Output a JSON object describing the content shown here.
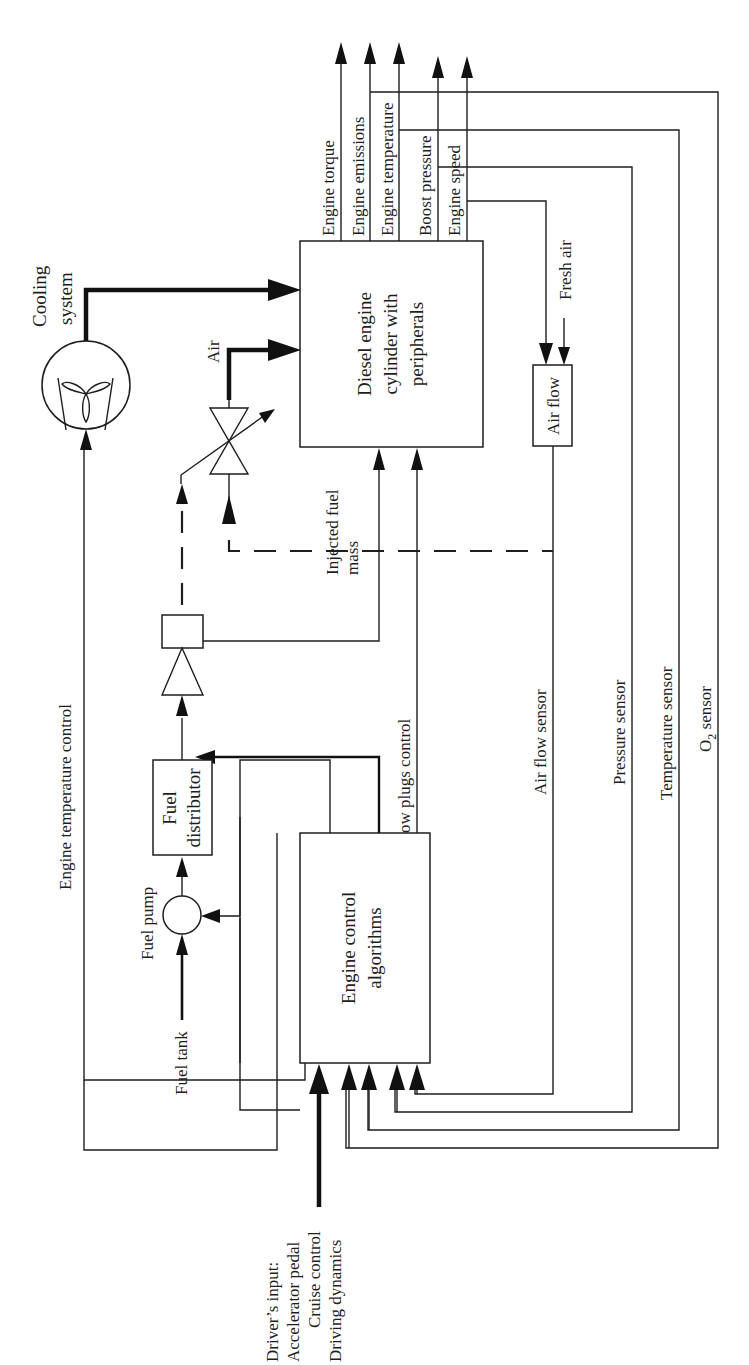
{
  "diagram": {
    "orientation": "rotated-90-ccw",
    "blocks": {
      "diesel_engine": [
        "Diesel engine",
        "cylinder with",
        "peripherals"
      ],
      "engine_control": [
        "Engine control",
        "algorithms"
      ],
      "fuel_distributor": [
        "Fuel",
        "distributor"
      ],
      "air_flow": "Air flow",
      "cooling_system": [
        "Cooling",
        "system"
      ]
    },
    "outputs": [
      {
        "id": "torque",
        "label": "Engine torque"
      },
      {
        "id": "emissions",
        "label": "Engine emissions"
      },
      {
        "id": "temperature",
        "label": "Engine temperature"
      },
      {
        "id": "boost",
        "label": "Boost pressure"
      },
      {
        "id": "speed",
        "label": "Engine speed"
      }
    ],
    "labels": {
      "fresh_air": "Fresh air",
      "air": "Air",
      "injected_fuel_mass": [
        "Injected fuel",
        "mass"
      ],
      "glow_plugs_control": "Glow plugs control",
      "fuel_injection_time": "Fuel injection time",
      "engine_temperature_control": "Engine temperature control",
      "fuel_pump": "Fuel pump",
      "fuel_tank": "Fuel tank",
      "air_flow_sensor": "Air flow sensor",
      "pressure_sensor": "Pressure sensor",
      "temperature_sensor": "Temperature sensor",
      "o2_sensor_main": "O",
      "o2_sensor_sub": "2",
      "o2_sensor_rest": " sensor",
      "drivers_input": [
        "Driver’s input:",
        "Accelerator pedal",
        "Cruise control",
        "Driving dynamics"
      ]
    },
    "colors": {
      "line": "#1e1e1e",
      "background": "#ffffff"
    }
  }
}
